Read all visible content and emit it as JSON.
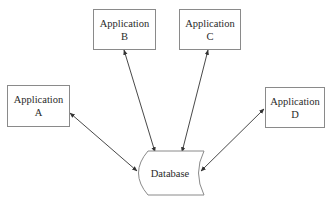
{
  "diagram": {
    "nodes": [
      {
        "id": "app-a",
        "line1": "Application",
        "line2": "A",
        "shape": "rectangle"
      },
      {
        "id": "app-b",
        "line1": "Application",
        "line2": "B",
        "shape": "rectangle"
      },
      {
        "id": "app-c",
        "line1": "Application",
        "line2": "C",
        "shape": "rectangle"
      },
      {
        "id": "app-d",
        "line1": "Application",
        "line2": "D",
        "shape": "rectangle"
      },
      {
        "id": "database",
        "label": "Database",
        "shape": "stored-data"
      }
    ],
    "edges": [
      {
        "from": "app-a",
        "to": "database",
        "direction": "both"
      },
      {
        "from": "app-b",
        "to": "database",
        "direction": "both"
      },
      {
        "from": "app-c",
        "to": "database",
        "direction": "both"
      },
      {
        "from": "app-d",
        "to": "database",
        "direction": "both"
      }
    ],
    "colors": {
      "stroke": "#8a8a8a",
      "edge": "#333333",
      "text": "#2a2a2a"
    }
  }
}
